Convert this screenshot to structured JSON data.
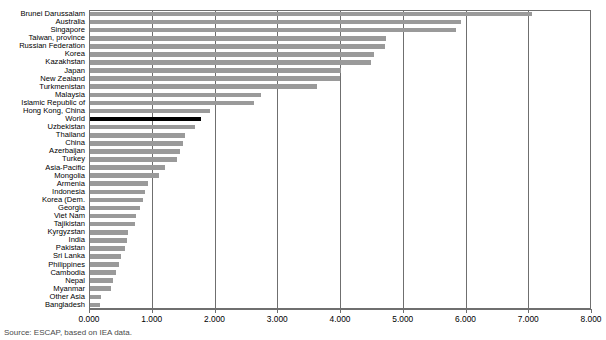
{
  "chart_data": {
    "type": "bar",
    "orientation": "horizontal",
    "title": "Figure: Energy intensity / per capita energy use (toe per capita), Asia-Pacific region",
    "xlabel": "",
    "ylabel": "",
    "xlim": [
      0,
      8
    ],
    "xticks": [
      "0.000",
      "1.000",
      "2.000",
      "3.000",
      "4.000",
      "5.000",
      "6.000",
      "7.000",
      "8.000"
    ],
    "grid": true,
    "legend": "none",
    "highlight_category": "World",
    "colors": {
      "bar": "#9a9a9a",
      "highlight_bar": "#000000",
      "axis": "#6f6f6f",
      "background": "#ffffff"
    },
    "categories": [
      "Brunei Darussalam",
      "Australia",
      "Singapore",
      "Taiwan, province",
      "Russian Federation",
      "Korea",
      "Kazakhstan",
      "Japan",
      "New Zealand",
      "Turkmenistan",
      "Malaysia",
      "Islamic Republic of",
      "Hong Kong, China",
      "World",
      "Uzbekistan",
      "Thailand",
      "China",
      "Azerbaijan",
      "Turkey",
      "Asia-Pacific",
      "Mongolia",
      "Armenia",
      "Indonesia",
      "Korea (Dem.",
      "Georgia",
      "Viet Nam",
      "Tajikistan",
      "Kyrgyzstan",
      "India",
      "Pakistan",
      "Sri Lanka",
      "Philippines",
      "Cambodia",
      "Nepal",
      "Myanmar",
      "Other Asia",
      "Bangladesh"
    ],
    "values": [
      7.05,
      5.92,
      5.84,
      4.72,
      4.7,
      4.52,
      4.48,
      4.0,
      3.98,
      3.62,
      2.72,
      2.62,
      1.92,
      1.77,
      1.67,
      1.51,
      1.48,
      1.43,
      1.38,
      1.19,
      1.1,
      0.92,
      0.87,
      0.84,
      0.79,
      0.74,
      0.71,
      0.61,
      0.59,
      0.56,
      0.5,
      0.47,
      0.41,
      0.37,
      0.34,
      0.18,
      0.16
    ]
  },
  "source": {
    "text": "Source: ESCAP, based on IEA data."
  }
}
